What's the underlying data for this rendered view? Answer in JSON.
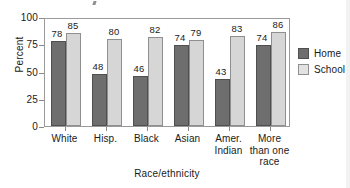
{
  "chart_data": {
    "type": "bar",
    "title": "",
    "xlabel": "Race/ethnicity",
    "ylabel": "Percent",
    "ylim": [
      0,
      100
    ],
    "yticks": [
      0,
      25,
      50,
      75,
      100
    ],
    "ytick_labels": [
      "0",
      "25",
      "50",
      "75",
      "100"
    ],
    "grid": false,
    "legend_position": "right",
    "categories": [
      "White",
      "Hisp.",
      "Black",
      "Asian",
      "Amer. Indian",
      "More than one race"
    ],
    "category_lines": [
      [
        "White"
      ],
      [
        "Hisp."
      ],
      [
        "Black"
      ],
      [
        "Asian"
      ],
      [
        "Amer.",
        "Indian"
      ],
      [
        "More",
        "than one",
        "race"
      ]
    ],
    "series": [
      {
        "name": "Home",
        "color": "#6e6e6e",
        "values": [
          78,
          48,
          46,
          74,
          43,
          74
        ]
      },
      {
        "name": "School",
        "color": "#d6d6d6",
        "values": [
          85,
          80,
          82,
          79,
          83,
          86
        ]
      }
    ]
  },
  "legend": {
    "items": [
      {
        "label": "Home",
        "swatch": "home"
      },
      {
        "label": "School",
        "swatch": "school"
      }
    ]
  }
}
